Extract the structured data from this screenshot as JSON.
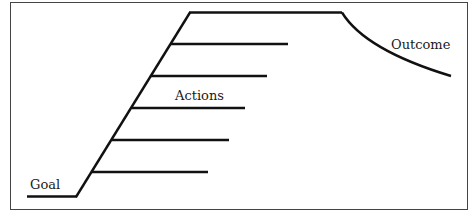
{
  "diagram": {
    "labels": {
      "goal": "Goal",
      "actions": "Actions",
      "outcome": "Outcome"
    },
    "action_rungs_count": 5,
    "colors": {
      "line": "#111111",
      "border": "#444444",
      "background": "#ffffff"
    }
  }
}
